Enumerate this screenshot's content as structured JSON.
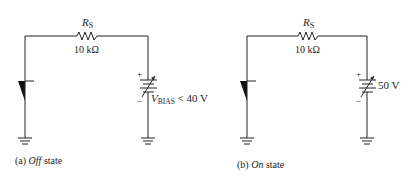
{
  "panels": [
    {
      "id": "a",
      "resistor_label": "R",
      "resistor_sub": "S",
      "resistor_value": "10 kΩ",
      "battery_plus": "+",
      "battery_minus": "–",
      "battery_label_main": "V",
      "battery_label_sub": "BIAS",
      "battery_label_rest": " < 40 V",
      "caption_prefix": "(a) ",
      "caption_italic": "Off",
      "caption_suffix": " state"
    },
    {
      "id": "b",
      "resistor_label": "R",
      "resistor_sub": "S",
      "resistor_value": "10 kΩ",
      "battery_plus": "+",
      "battery_minus": "–",
      "battery_value": "50 V",
      "caption_prefix": "(b) ",
      "caption_italic": "On",
      "caption_suffix": " state"
    }
  ]
}
